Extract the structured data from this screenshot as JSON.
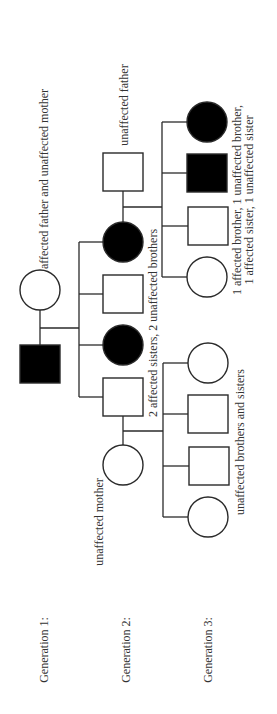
{
  "diagram": {
    "type": "pedigree",
    "orientation": "rotated-90-ccw",
    "colors": {
      "line": "#2a2a2a",
      "affected_fill": "#000000",
      "unaffected_fill": "#ffffff",
      "text": "#333333"
    },
    "generation_labels": [
      {
        "id": "gen1",
        "text": "Generation 1:",
        "x": 44,
        "y": 650
      },
      {
        "id": "gen2",
        "text": "Generation 2:",
        "x": 126,
        "y": 650
      },
      {
        "id": "gen3",
        "text": "Generation 3:",
        "x": 208,
        "y": 650
      }
    ],
    "annotations": [
      {
        "id": "gen1-parents-note",
        "text": "affected father and unaffected mother",
        "x": 44,
        "y": 179
      },
      {
        "id": "gen2-father-note",
        "text": "unaffected father",
        "x": 124,
        "y": 105
      },
      {
        "id": "gen2-siblings-note",
        "text": "2 affected sisters, 2 unaffected brothers",
        "x": 153,
        "y": 323
      },
      {
        "id": "gen2-mother-note",
        "text": "unaffected mother",
        "x": 99,
        "y": 522
      },
      {
        "id": "gen3-right-note-line1",
        "text": "1 affected brother, 1 unaffected brother,",
        "x": 237,
        "y": 200
      },
      {
        "id": "gen3-right-note-line2",
        "text": "1 affected sister, 1 unaffected sister",
        "x": 249,
        "y": 200
      },
      {
        "id": "gen3-left-note",
        "text": "unaffected brothers and sisters",
        "x": 240,
        "y": 442
      }
    ],
    "individuals": [
      {
        "id": "g1-mother",
        "generation": 1,
        "sex": "female",
        "affected": false,
        "cx": 40,
        "cy": 290
      },
      {
        "id": "g1-father",
        "generation": 1,
        "sex": "male",
        "affected": true,
        "cx": 40,
        "cy": 364
      },
      {
        "id": "g2-spouse-father",
        "generation": 2,
        "sex": "male",
        "affected": false,
        "cx": 123,
        "cy": 172
      },
      {
        "id": "g2-daughter-1",
        "generation": 2,
        "sex": "female",
        "affected": true,
        "cx": 123,
        "cy": 242
      },
      {
        "id": "g2-son-1",
        "generation": 2,
        "sex": "male",
        "affected": false,
        "cx": 123,
        "cy": 294
      },
      {
        "id": "g2-daughter-2",
        "generation": 2,
        "sex": "female",
        "affected": true,
        "cx": 123,
        "cy": 345
      },
      {
        "id": "g2-son-2",
        "generation": 2,
        "sex": "male",
        "affected": false,
        "cx": 123,
        "cy": 397
      },
      {
        "id": "g2-spouse-mother",
        "generation": 2,
        "sex": "female",
        "affected": false,
        "cx": 123,
        "cy": 465
      },
      {
        "id": "g3-right-daughter-affected",
        "generation": 3,
        "sex": "female",
        "affected": true,
        "cx": 207,
        "cy": 122
      },
      {
        "id": "g3-right-son-affected",
        "generation": 3,
        "sex": "male",
        "affected": true,
        "cx": 207,
        "cy": 173
      },
      {
        "id": "g3-right-son-unaffected",
        "generation": 3,
        "sex": "male",
        "affected": false,
        "cx": 208,
        "cy": 226
      },
      {
        "id": "g3-right-daughter-unaffected",
        "generation": 3,
        "sex": "female",
        "affected": false,
        "cx": 207,
        "cy": 277
      },
      {
        "id": "g3-left-daughter-1",
        "generation": 3,
        "sex": "female",
        "affected": false,
        "cx": 208,
        "cy": 363
      },
      {
        "id": "g3-left-son-1",
        "generation": 3,
        "sex": "male",
        "affected": false,
        "cx": 208,
        "cy": 414
      },
      {
        "id": "g3-left-son-2",
        "generation": 3,
        "sex": "male",
        "affected": false,
        "cx": 209,
        "cy": 466
      },
      {
        "id": "g3-left-daughter-2",
        "generation": 3,
        "sex": "female",
        "affected": false,
        "cx": 208,
        "cy": 517
      }
    ],
    "symbol_size": {
      "circle_radius": 20,
      "square_half": 19
    },
    "lines": [
      {
        "id": "g1-couple-link",
        "d": "M40 310 L40 345"
      },
      {
        "id": "g1-descent",
        "d": "M40 328 L79 328"
      },
      {
        "id": "g2-sibship-bar",
        "d": "M79 242 L79 397"
      },
      {
        "id": "g2-branch-daughter-1",
        "d": "M79 242 L103 242"
      },
      {
        "id": "g2-branch-son-1",
        "d": "M79 294 L104 294"
      },
      {
        "id": "g2-branch-daughter-2",
        "d": "M79 345 L103 345"
      },
      {
        "id": "g2-branch-son-2",
        "d": "M79 397 L104 397"
      },
      {
        "id": "g2-right-couple-link",
        "d": "M123 191 L123 222"
      },
      {
        "id": "g2-right-descent",
        "d": "M123 207 L162 207"
      },
      {
        "id": "g3-right-sibship-bar",
        "d": "M162 122 L162 277"
      },
      {
        "id": "g3-right-branch-1",
        "d": "M162 122 L187 122"
      },
      {
        "id": "g3-right-branch-2",
        "d": "M162 173 L188 173"
      },
      {
        "id": "g3-right-branch-3",
        "d": "M162 226 L189 226"
      },
      {
        "id": "g3-right-branch-4",
        "d": "M162 277 L187 277"
      },
      {
        "id": "g2-left-couple-link",
        "d": "M123 416 L123 445"
      },
      {
        "id": "g2-left-descent",
        "d": "M123 431 L163 431"
      },
      {
        "id": "g3-left-sibship-bar",
        "d": "M163 363 L163 517"
      },
      {
        "id": "g3-left-branch-1",
        "d": "M163 363 L188 363"
      },
      {
        "id": "g3-left-branch-2",
        "d": "M163 414 L189 414"
      },
      {
        "id": "g3-left-branch-3",
        "d": "M163 466 L190 466"
      },
      {
        "id": "g3-left-branch-4",
        "d": "M163 517 L188 517"
      }
    ]
  }
}
